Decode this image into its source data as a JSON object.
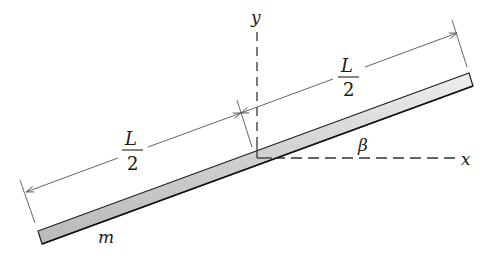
{
  "figure": {
    "type": "mechanics-diagram",
    "labels": {
      "y_axis": "y",
      "x_axis": "x",
      "angle": "β",
      "mass": "m",
      "half_length_left_num": "L",
      "half_length_left_den": "2",
      "half_length_right_num": "L",
      "half_length_right_den": "2"
    },
    "colors": {
      "rod_fill": "#d4d4d4",
      "rod_edge": "#222222",
      "lines": "#333333",
      "dim_lines": "#555555"
    }
  }
}
